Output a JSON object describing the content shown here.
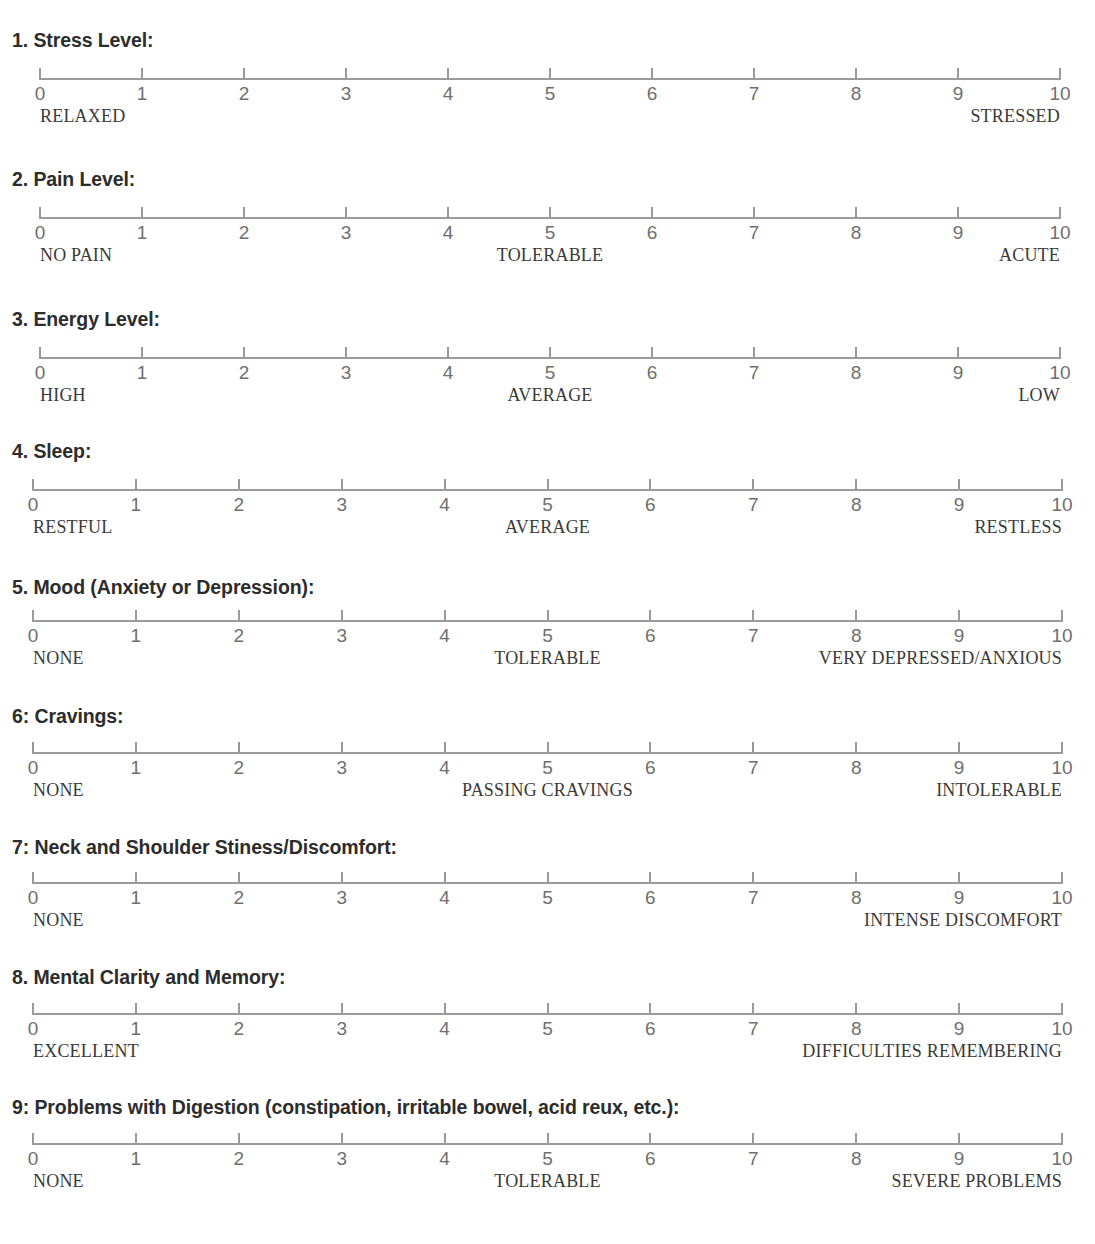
{
  "document": {
    "kind": "symptom-rating-questionnaire",
    "scale_min_label": "0",
    "scale_max_label": "10",
    "tick_labels": [
      "0",
      "1",
      "2",
      "3",
      "4",
      "5",
      "6",
      "7",
      "8",
      "9",
      "10"
    ],
    "line_color": "#9a9a9a",
    "title_color": "#2c2c2c",
    "number_color": "#6f6f6f",
    "anchor_color": "#3a3a3a"
  },
  "items": [
    {
      "title": "1. Stress Level:",
      "top": 31,
      "scale_left": 40,
      "scale_right": 1060,
      "scale_top": 68,
      "anchors": [
        {
          "text": "RELAXED",
          "align": "left",
          "at": 0
        },
        {
          "text": "STRESSED",
          "align": "right",
          "at": 10
        }
      ]
    },
    {
      "title": "2. Pain Level:",
      "top": 170,
      "scale_left": 40,
      "scale_right": 1060,
      "scale_top": 207,
      "anchors": [
        {
          "text": "NO PAIN",
          "align": "left",
          "at": 0
        },
        {
          "text": "TOLERABLE",
          "align": "center",
          "at": 5
        },
        {
          "text": "ACUTE",
          "align": "right",
          "at": 10
        }
      ]
    },
    {
      "title": "3. Energy Level:",
      "top": 310,
      "scale_left": 40,
      "scale_right": 1060,
      "scale_top": 347,
      "anchors": [
        {
          "text": "HIGH",
          "align": "left",
          "at": 0
        },
        {
          "text": "AVERAGE",
          "align": "center",
          "at": 5
        },
        {
          "text": "LOW",
          "align": "right",
          "at": 10
        }
      ]
    },
    {
      "title": "4. Sleep:",
      "top": 442,
      "scale_left": 33,
      "scale_right": 1062,
      "scale_top": 479,
      "anchors": [
        {
          "text": "RESTFUL",
          "align": "left",
          "at": 0
        },
        {
          "text": "AVERAGE",
          "align": "center",
          "at": 5
        },
        {
          "text": "RESTLESS",
          "align": "right",
          "at": 10
        }
      ]
    },
    {
      "title": "5. Mood (Anxiety or Depression):",
      "top": 578,
      "scale_left": 33,
      "scale_right": 1062,
      "scale_top": 610,
      "anchors": [
        {
          "text": "NONE",
          "align": "left",
          "at": 0
        },
        {
          "text": "TOLERABLE",
          "align": "center",
          "at": 5
        },
        {
          "text": "VERY DEPRESSED/ANXIOUS",
          "align": "right",
          "at": 10
        }
      ]
    },
    {
      "title": "6: Cravings:",
      "top": 707,
      "scale_left": 33,
      "scale_right": 1062,
      "scale_top": 742,
      "anchors": [
        {
          "text": "NONE",
          "align": "left",
          "at": 0
        },
        {
          "text": "PASSING CRAVINGS",
          "align": "center",
          "at": 5
        },
        {
          "text": "INTOLERABLE",
          "align": "right",
          "at": 10
        }
      ]
    },
    {
      "title": "7: Neck and Shoulder Stiness/Discomfort:",
      "top": 838,
      "scale_left": 33,
      "scale_right": 1062,
      "scale_top": 872,
      "anchors": [
        {
          "text": "NONE",
          "align": "left",
          "at": 0
        },
        {
          "text": "INTENSE DISCOMFORT",
          "align": "right",
          "at": 10
        }
      ]
    },
    {
      "title": "8. Mental Clarity and Memory:",
      "top": 968,
      "scale_left": 33,
      "scale_right": 1062,
      "scale_top": 1003,
      "anchors": [
        {
          "text": "EXCELLENT",
          "align": "left",
          "at": 0
        },
        {
          "text": "DIFFICULTIES REMEMBERING",
          "align": "right",
          "at": 10
        }
      ]
    },
    {
      "title": "9: Problems with Digestion (constipation, irritable bowel, acid reux, etc.):",
      "top": 1098,
      "scale_left": 33,
      "scale_right": 1062,
      "scale_top": 1133,
      "anchors": [
        {
          "text": "NONE",
          "align": "left",
          "at": 0
        },
        {
          "text": "TOLERABLE",
          "align": "center",
          "at": 5
        },
        {
          "text": "SEVERE PROBLEMS",
          "align": "right",
          "at": 10
        }
      ]
    }
  ],
  "truncated_item": {
    "top": 1232,
    "note_visible": false
  }
}
